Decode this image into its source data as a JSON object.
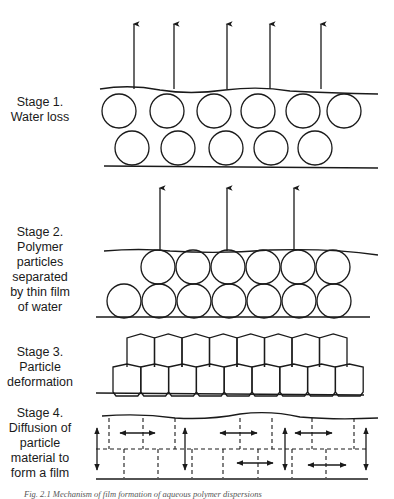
{
  "stages": [
    {
      "id": "stage1",
      "title": "Stage 1.",
      "lines": [
        "Stage 1.",
        "Water loss"
      ]
    },
    {
      "id": "stage2",
      "title": "Stage 2.",
      "lines": [
        "Stage 2.",
        "Polymer",
        "particles",
        "separated",
        "by thin film",
        "of water"
      ]
    },
    {
      "id": "stage3",
      "title": "Stage 3.",
      "lines": [
        "Stage 3.",
        "Particle",
        "deformation"
      ]
    },
    {
      "id": "stage4",
      "title": "Stage 4.",
      "lines": [
        "Stage 4.",
        "Diffusion of",
        "particle",
        "material to",
        "form a film"
      ]
    }
  ],
  "caption": "Fig. 2.1  Mechanism of film formation of aqueous polymer dispersions",
  "diagram": {
    "stroke_color": "#1a1a1a",
    "stage1": {
      "arrows_x": [
        134,
        174,
        227,
        270,
        321
      ],
      "top_row_cx": [
        119,
        167,
        214,
        258,
        303,
        344
      ],
      "bottom_row_cx": [
        132,
        178,
        226,
        271,
        315
      ]
    },
    "stage2": {
      "arrows_x": [
        160,
        227,
        294
      ],
      "top_row_cx": [
        158,
        193,
        228,
        263,
        298,
        333
      ],
      "bottom_row_cx": [
        124,
        159,
        194,
        229,
        264,
        299,
        334
      ]
    },
    "stage3": {
      "top_cols": 8,
      "bottom_cols": 9
    }
  }
}
